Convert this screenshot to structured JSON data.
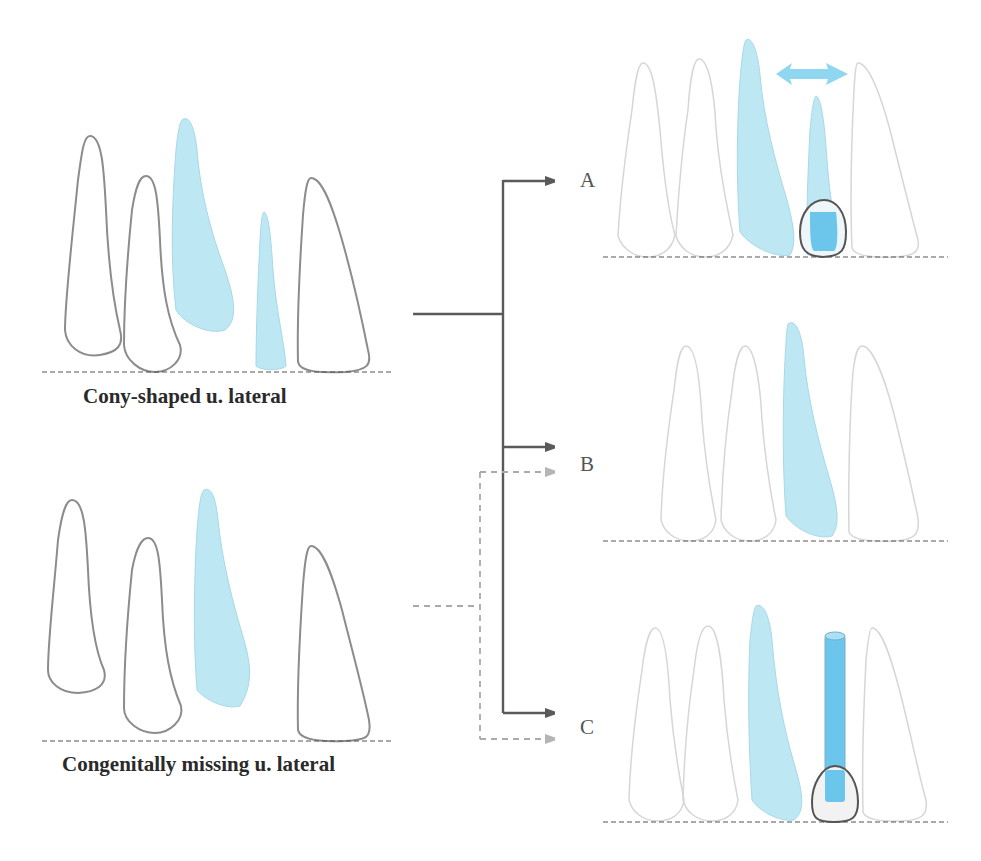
{
  "colors": {
    "tooth_outline_dark": "#8c8c8c",
    "tooth_outline_light": "#d6d6d6",
    "tooth_fill_blue": "#bde8f3",
    "implant_blue": "#6cc6ec",
    "arrow_dark": "#5a5a5a",
    "arrow_dashed": "#aaaaaa",
    "baseline": "#555555"
  },
  "conditions": [
    {
      "label": "Cony-shaped u. lateral"
    },
    {
      "label": "Congenitally missing u. lateral"
    }
  ],
  "options": [
    {
      "label": "A"
    },
    {
      "label": "B"
    },
    {
      "label": "C"
    }
  ]
}
